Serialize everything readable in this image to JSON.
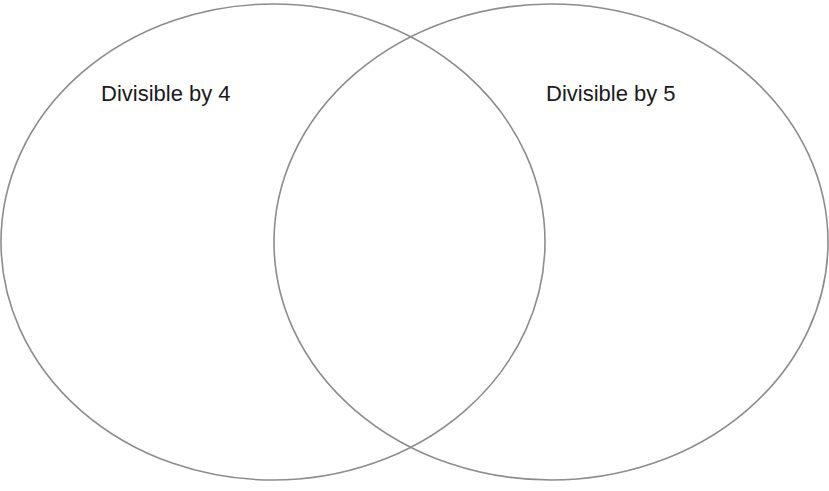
{
  "diagram": {
    "type": "venn",
    "stroke_color": "#8c8c8c",
    "background": "#ffffff",
    "sets": [
      {
        "id": "A",
        "label": "Divisible by 4",
        "ellipse": {
          "cx": 273,
          "cy": 242,
          "rx": 273,
          "ry": 238
        }
      },
      {
        "id": "B",
        "label": "Divisible by 5",
        "ellipse": {
          "cx": 551,
          "cy": 242,
          "rx": 278,
          "ry": 238
        }
      }
    ]
  }
}
